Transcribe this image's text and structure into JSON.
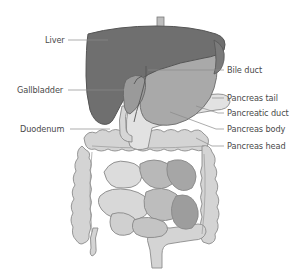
{
  "diagram": {
    "colors": {
      "liver": "#6f6f6f",
      "liver_edge": "#555555",
      "stomach": "#a9a9a9",
      "gallbladder": "#9a9a9a",
      "intestine": "#d2d2d2",
      "intestine_edge": "#8c8c8c",
      "pancreas": "#e2e2e2",
      "leader_line": "#8a8a8a",
      "label_text": "#4a4a4a"
    },
    "labels": {
      "liver": "Liver",
      "gallbladder": "Gallbladder",
      "duodenum": "Duodenum",
      "bile_duct": "Bile duct",
      "pancreas_tail": "Pancreas tail",
      "pancreatic_duct": "Pancreatic duct",
      "pancreas_body": "Pancreas body",
      "pancreas_head": "Pancreas head"
    }
  }
}
